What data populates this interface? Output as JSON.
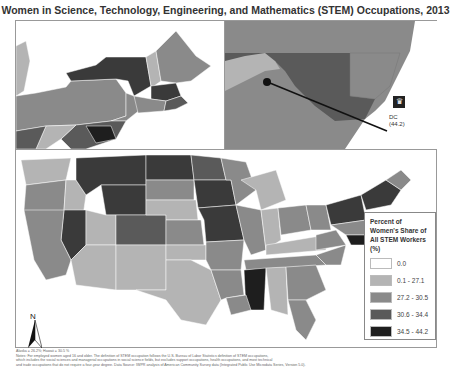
{
  "title": "Women in Science, Technology, Engineering, and Mathematics (STEM) Occupations, 2013",
  "legend": {
    "title": "Percent of Women's Share of All STEM Workers (%)",
    "items": [
      {
        "label": "0.0",
        "color": "#ffffff"
      },
      {
        "label": "0.1 - 27.1",
        "color": "#b4b4b4"
      },
      {
        "label": "27.2 - 30.5",
        "color": "#8a8a8a"
      },
      {
        "label": "30.6 - 34.4",
        "color": "#5a5a5a"
      },
      {
        "label": "34.5 - 44.2",
        "color": "#1e1e1e"
      }
    ]
  },
  "insets": {
    "dc": {
      "label": "DC",
      "value": "(44.2)",
      "icon": "capital-crown-icon",
      "md_value": "34.4"
    }
  },
  "north_arrow": {
    "label": "N"
  },
  "notes": {
    "line1": "Alaska = 26.2%; Hawaii = 30.5 %",
    "line2": "Notes: For employed women aged 16 and older. The definition of STEM occupation follows the U.S. Bureau of Labor Statistics definition of STEM occupations,",
    "line3": "which includes the social sciences and managerial occupations in social science fields, but excludes support occupations, health occupations, and most technical",
    "line4": "and trade occupations that do not require a four-year degree. Data Source: IWPR analysis of American Community Survey data (Integrated Public Use Microdata Series, Version 5.0)."
  }
}
